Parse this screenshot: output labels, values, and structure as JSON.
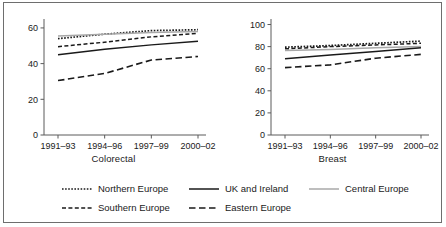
{
  "figure": {
    "panels": [
      "Colorectal",
      "Breast"
    ],
    "legend_position": "bottom",
    "grid": false,
    "border": true
  },
  "axis": {
    "x_categories": [
      "1991–93",
      "1994–96",
      "1997–99",
      "2000–02"
    ],
    "left_y_ticks": [
      "0",
      "20",
      "40",
      "60"
    ],
    "right_y_ticks": [
      "0",
      "20",
      "40",
      "60",
      "80",
      "100"
    ]
  },
  "legend": {
    "items": [
      {
        "label": "Northern Europe",
        "style": "fine-dotted",
        "color": "#1a1a1a"
      },
      {
        "label": "UK and Ireland",
        "style": "solid",
        "color": "#1a1a1a"
      },
      {
        "label": "Central Europe",
        "style": "solid",
        "color": "#a8a8a8"
      },
      {
        "label": "Southern Europe",
        "style": "dashed",
        "color": "#1a1a1a"
      },
      {
        "label": "Eastern Europe",
        "style": "long-dashed",
        "color": "#1a1a1a"
      }
    ]
  },
  "chart_data": [
    {
      "type": "line",
      "title": "Colorectal",
      "xlabel": "",
      "ylabel": "",
      "categories": [
        "1991–93",
        "1994–96",
        "1997–99",
        "2000–02"
      ],
      "ylim": [
        0,
        65
      ],
      "yticks": [
        0,
        20,
        40,
        60
      ],
      "grid": false,
      "series": [
        {
          "name": "Northern Europe",
          "values": [
            54.0,
            56.5,
            58.5,
            59.0
          ],
          "style": "fine-dotted",
          "color": "#1a1a1a"
        },
        {
          "name": "Central Europe",
          "values": [
            55.5,
            56.5,
            57.5,
            58.0
          ],
          "style": "solid",
          "color": "#a8a8a8"
        },
        {
          "name": "Southern Europe",
          "values": [
            49.5,
            52.0,
            55.0,
            57.0
          ],
          "style": "dashed",
          "color": "#1a1a1a"
        },
        {
          "name": "UK and Ireland",
          "values": [
            45.0,
            48.0,
            50.5,
            52.5
          ],
          "style": "solid",
          "color": "#1a1a1a"
        },
        {
          "name": "Eastern Europe",
          "values": [
            30.5,
            34.5,
            42.0,
            44.0
          ],
          "style": "long-dashed",
          "color": "#1a1a1a"
        }
      ]
    },
    {
      "type": "line",
      "title": "Breast",
      "xlabel": "",
      "ylabel": "",
      "categories": [
        "1991–93",
        "1994–96",
        "1997–99",
        "2000–02"
      ],
      "ylim": [
        0,
        105
      ],
      "yticks": [
        0,
        20,
        40,
        60,
        80,
        100
      ],
      "grid": false,
      "series": [
        {
          "name": "Northern Europe",
          "values": [
            79.5,
            81.0,
            83.0,
            85.0
          ],
          "style": "fine-dotted",
          "color": "#1a1a1a"
        },
        {
          "name": "Southern Europe",
          "values": [
            78.0,
            80.0,
            81.5,
            83.0
          ],
          "style": "dashed",
          "color": "#1a1a1a"
        },
        {
          "name": "Central Europe",
          "values": [
            76.5,
            77.5,
            79.0,
            80.0
          ],
          "style": "solid",
          "color": "#a8a8a8"
        },
        {
          "name": "UK and Ireland",
          "values": [
            69.0,
            72.5,
            75.5,
            79.0
          ],
          "style": "solid",
          "color": "#1a1a1a"
        },
        {
          "name": "Eastern Europe",
          "values": [
            61.0,
            63.5,
            69.5,
            73.0
          ],
          "style": "long-dashed",
          "color": "#1a1a1a"
        }
      ]
    }
  ]
}
